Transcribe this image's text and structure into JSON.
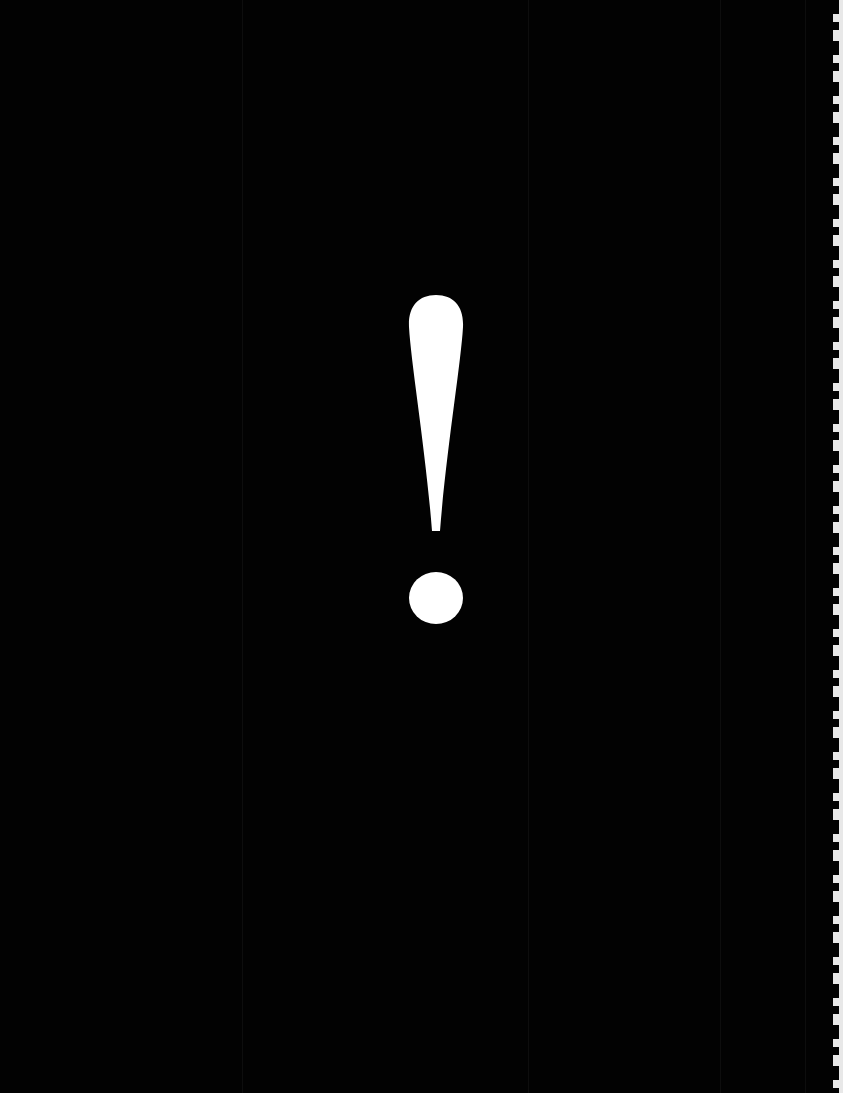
{
  "page": {
    "symbol": "!",
    "symbol_name": "exclamation-mark",
    "colors": {
      "background": "#020202",
      "symbol": "#ffffff",
      "page_edge": "#e8e8e8"
    }
  }
}
